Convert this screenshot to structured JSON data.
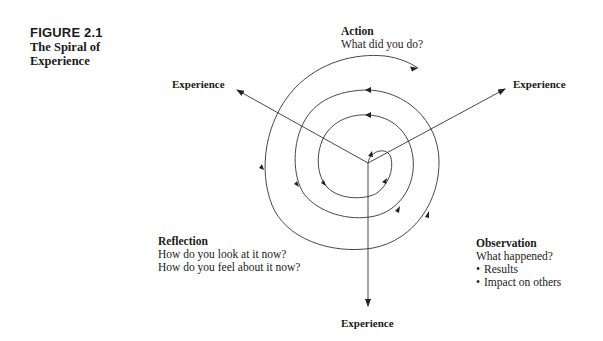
{
  "figure": {
    "number": "FIGURE 2.1",
    "title_line1": "The Spiral of",
    "title_line2": "Experience"
  },
  "stages": {
    "action": {
      "heading": "Action",
      "question": "What did you do?"
    },
    "observation": {
      "heading": "Observation",
      "question": "What happened?",
      "bullets": [
        "Results",
        "Impact on others"
      ]
    },
    "reflection": {
      "heading": "Reflection",
      "questions": [
        "How do you look at it now?",
        "How do you feel about it now?"
      ]
    }
  },
  "axes": {
    "upper_left": "Experience",
    "upper_right": "Experience",
    "bottom": "Experience"
  },
  "colors": {
    "line": "#333333",
    "text": "#1a1a1a",
    "background": "#ffffff"
  }
}
